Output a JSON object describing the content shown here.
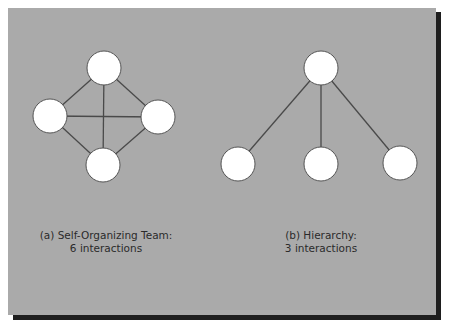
{
  "colors": {
    "panel": "#aaaaaa",
    "shadow": "#1e1e1e",
    "node_fill": "#ffffff",
    "node_stroke": "#555555",
    "edge": "#4a4a4a",
    "text": "#2a2a2a"
  },
  "diagrams": [
    {
      "id": "a",
      "caption_line1": "(a) Self-Organizing Team:",
      "caption_line2": "6 interactions",
      "nodes": [
        {
          "id": "top",
          "x": 104,
          "y": 68
        },
        {
          "id": "left",
          "x": 50,
          "y": 116
        },
        {
          "id": "right",
          "x": 158,
          "y": 117
        },
        {
          "id": "bottom",
          "x": 103,
          "y": 165
        }
      ],
      "edges": [
        [
          "top",
          "left"
        ],
        [
          "top",
          "right"
        ],
        [
          "top",
          "bottom"
        ],
        [
          "left",
          "right"
        ],
        [
          "left",
          "bottom"
        ],
        [
          "right",
          "bottom"
        ]
      ]
    },
    {
      "id": "b",
      "caption_line1": "(b) Hierarchy:",
      "caption_line2": "3 interactions",
      "nodes": [
        {
          "id": "root",
          "x": 321,
          "y": 68
        },
        {
          "id": "child1",
          "x": 238,
          "y": 164
        },
        {
          "id": "child2",
          "x": 321,
          "y": 164
        },
        {
          "id": "child3",
          "x": 400,
          "y": 163
        }
      ],
      "edges": [
        [
          "root",
          "child1"
        ],
        [
          "root",
          "child2"
        ],
        [
          "root",
          "child3"
        ]
      ]
    }
  ],
  "node_radius": 17
}
